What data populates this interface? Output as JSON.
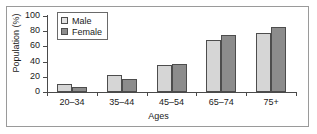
{
  "chart_data": {
    "type": "bar",
    "title": "",
    "xlabel": "Ages",
    "ylabel": "Population (%)",
    "categories": [
      "20–34",
      "35–44",
      "45–54",
      "65–74",
      "75+"
    ],
    "series": [
      {
        "name": "Male",
        "color": "#d6d6d6",
        "values": [
          11,
          23,
          35,
          68.5,
          78
        ]
      },
      {
        "name": "Female",
        "color": "#8c8c8c",
        "values": [
          6.5,
          17,
          36.5,
          74.5,
          86
        ]
      }
    ],
    "ylim": [
      0,
      100
    ],
    "yticks": [
      0,
      20,
      40,
      60,
      80,
      100
    ],
    "ytick_labels": [
      "0",
      "20",
      "40",
      "60",
      "80",
      "100"
    ],
    "grid": false,
    "legend_position": "top-left",
    "legend_entries": [
      "Male",
      "Female"
    ],
    "frame_color": "#9a9a9a",
    "axis_color": "#4a4a4a",
    "bar_edge_color": "#4d4d4d"
  }
}
